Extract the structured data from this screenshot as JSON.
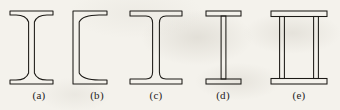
{
  "figure": {
    "name": "steel-beam-cross-sections",
    "background_color": "#f4f2ec",
    "line_color": "#1c1a16",
    "label_color": "#24211c",
    "width": 340,
    "height": 110
  },
  "sections": [
    {
      "id": "a",
      "label": "(a)",
      "name": "i-beam-tapered-flange",
      "description": "I-beam with tapered sloping flanges",
      "label_center_x": 39,
      "geometry": {
        "flange_left": 10,
        "flange_right": 53,
        "web_center": 31.5,
        "web_half_width": 2.6,
        "top_y": 11,
        "bottom_y": 84,
        "flange_thickness": 4,
        "flange_taper": 6
      }
    },
    {
      "id": "b",
      "label": "(b)",
      "name": "channel-c-section",
      "description": "Channel C-section with tapered flanges",
      "label_center_x": 97,
      "geometry": {
        "web_left": 73,
        "web_right": 78.5,
        "flange_right": 107,
        "top_y": 11,
        "bottom_y": 84,
        "flange_thickness": 4,
        "flange_taper": 6
      }
    },
    {
      "id": "c",
      "label": "(c)",
      "name": "wide-flange-h-beam",
      "description": "Wide-flange H-beam with parallel flanges",
      "label_center_x": 156,
      "geometry": {
        "flange_left": 130,
        "flange_right": 182,
        "web_center": 156,
        "web_half_width": 3.4,
        "top_y": 11,
        "bottom_y": 84,
        "flange_thickness": 5
      }
    },
    {
      "id": "d",
      "label": "(d)",
      "name": "welded-plate-girder",
      "description": "Welded plate girder with rectangular flange plates",
      "label_center_x": 223,
      "geometry": {
        "flange_left": 206,
        "flange_right": 241,
        "web_center": 223.5,
        "web_half_width": 2.4,
        "top_y": 11,
        "bottom_y": 84,
        "flange_thickness": 5
      }
    },
    {
      "id": "e",
      "label": "(e)",
      "name": "box-girder-twin-web",
      "description": "Box girder with wide flange plates and two vertical webs",
      "label_center_x": 299,
      "geometry": {
        "flange_left": 271,
        "flange_right": 327,
        "web_left_center": 282,
        "web_right_center": 316,
        "web_half_width": 2.4,
        "top_y": 11,
        "bottom_y": 84,
        "flange_thickness": 5.5
      }
    }
  ]
}
